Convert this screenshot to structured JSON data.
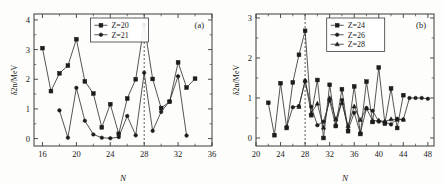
{
  "figure": {
    "background_color": "#fdfdfb",
    "line_color": "#2b2b2b",
    "marker_color": "#1c1c1c",
    "axis_color": "#3a3a3a"
  },
  "panels": [
    {
      "tag": "(a)",
      "xlabel": "N",
      "ylabel": "δ2n/MeV",
      "xticks": [
        "16",
        "20",
        "24",
        "28",
        "32",
        "36"
      ],
      "yticks": [
        "0",
        "1",
        "2",
        "3",
        "4"
      ],
      "legend": [
        "Z=20",
        "Z=21"
      ]
    },
    {
      "tag": "(b)",
      "xlabel": "N",
      "ylabel": "δ2n/MeV",
      "xticks": [
        "20",
        "24",
        "28",
        "32",
        "36",
        "40",
        "44",
        "48"
      ],
      "yticks": [
        "0",
        "1",
        "2",
        "3"
      ],
      "legend": [
        "Z=24",
        "Z=26",
        "Z=28"
      ]
    }
  ],
  "chart_data": [
    {
      "type": "line",
      "title": "",
      "panel": "(a)",
      "xlabel": "N",
      "ylabel": "δ2n/MeV",
      "xlim": [
        15,
        36
      ],
      "ylim": [
        -0.25,
        4.2
      ],
      "xticks": [
        16,
        20,
        24,
        28,
        32,
        36
      ],
      "yticks": [
        0,
        1,
        2,
        3,
        4
      ],
      "grid": false,
      "legend_position": "top-center",
      "annotations": [
        {
          "type": "vline",
          "x": 28,
          "style": "dotted",
          "label": "magic number N=28"
        }
      ],
      "series": [
        {
          "name": "Z=20",
          "marker": "square",
          "x": [
            16,
            17,
            18,
            19,
            20,
            21,
            22,
            23,
            24,
            25,
            26,
            27,
            28,
            29,
            30,
            31,
            32,
            33,
            34
          ],
          "values": [
            3.05,
            1.6,
            2.2,
            2.46,
            3.35,
            1.93,
            1.52,
            0.38,
            1.16,
            0.16,
            1.35,
            2.0,
            3.83,
            2.01,
            1.03,
            1.24,
            2.57,
            1.72,
            2.02
          ]
        },
        {
          "name": "Z=21",
          "marker": "circle",
          "x": [
            18,
            19,
            20,
            21,
            22,
            23,
            24,
            25,
            26,
            27,
            28,
            29,
            30,
            31,
            32,
            33
          ],
          "values": [
            0.95,
            0.03,
            1.71,
            0.6,
            0.14,
            0.03,
            0.01,
            0.05,
            0.76,
            0.11,
            2.22,
            0.26,
            0.9,
            1.26,
            2.1,
            0.1
          ]
        }
      ]
    },
    {
      "type": "line",
      "title": "",
      "panel": "(b)",
      "xlabel": "N",
      "ylabel": "δ2n/MeV",
      "xlim": [
        20,
        49
      ],
      "ylim": [
        -0.2,
        3.1
      ],
      "xticks": [
        20,
        24,
        28,
        32,
        36,
        40,
        44,
        48
      ],
      "yticks": [
        0,
        1,
        2,
        3
      ],
      "grid": false,
      "legend_position": "top-center",
      "annotations": [
        {
          "type": "vline",
          "x": 28,
          "style": "dotted",
          "label": "magic number N=28"
        }
      ],
      "series": [
        {
          "name": "Z=24",
          "marker": "square",
          "x": [
            22,
            23,
            24,
            25,
            26,
            27,
            28,
            29,
            30,
            31,
            32,
            33,
            34,
            35,
            36,
            37,
            38,
            39,
            40,
            41,
            42,
            43,
            44
          ],
          "values": [
            0.88,
            0.07,
            1.37,
            0.25,
            1.39,
            2.08,
            2.68,
            0.57,
            1.45,
            0.0,
            1.33,
            0.3,
            1.22,
            0.17,
            1.29,
            0.1,
            1.41,
            0.4,
            1.76,
            0.36,
            1.24,
            0.25,
            1.07
          ]
        },
        {
          "name": "Z=26",
          "marker": "circle",
          "x": [
            25,
            26,
            27,
            28,
            29,
            30,
            31,
            32,
            33,
            34,
            35,
            36,
            37,
            38,
            39,
            40,
            41,
            42,
            43,
            44,
            45,
            46,
            47,
            48
          ],
          "values": [
            0.28,
            0.77,
            0.8,
            1.43,
            0.78,
            0.32,
            0.41,
            0.93,
            0.3,
            0.95,
            0.2,
            0.63,
            0.12,
            0.75,
            0.68,
            0.41,
            0.4,
            0.34,
            0.48,
            0.46,
            1.0,
            1.0,
            1.0,
            0.98
          ]
        },
        {
          "name": "Z=28",
          "marker": "triangle",
          "x": [
            27,
            28,
            29,
            30,
            31,
            32,
            33,
            34,
            35,
            36,
            37,
            38,
            39,
            40,
            41,
            42,
            43,
            44
          ],
          "values": [
            0.78,
            1.43,
            0.62,
            0.86,
            0.26,
            1.0,
            0.47,
            0.88,
            0.3,
            0.79,
            0.45,
            0.74,
            0.43,
            0.44,
            0.41,
            0.47,
            0.46,
            0.46
          ]
        }
      ]
    }
  ]
}
